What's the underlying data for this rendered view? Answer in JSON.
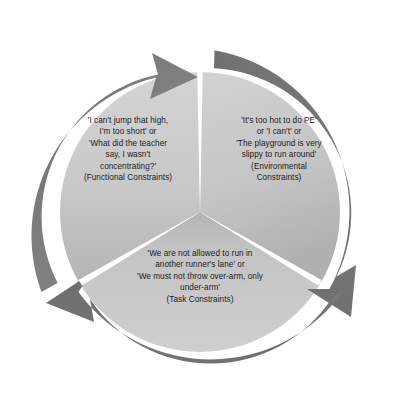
{
  "diagram": {
    "type": "cyclical-three-segment-pie",
    "title": "",
    "rotation_direction": "clockwise",
    "background_color": "#ffffff",
    "ring_color": "#7d7d7d",
    "ring_color_dark": "#6e6e6e",
    "segment_color_light": "#cfcfcf",
    "segment_color_mid": "#c2c2c2",
    "segment_color_dark": "#9e9e9e",
    "gap_color": "#ffffff",
    "text_color": "#1c1c1c",
    "segments": [
      {
        "id": "functional",
        "name": "Functional Constraints",
        "position": "left",
        "text": "'I can't jump that high,\nI'm too short' or\n'What did the teacher\nsay, I wasn't\nconcentrating?'\n(Functional Constraints)",
        "lines": [
          "'I can't jump that high,",
          "I'm too short' or",
          "'What did the teacher",
          "say, I wasn't",
          "concentrating?'",
          "(Functional Constraints)"
        ]
      },
      {
        "id": "environmental",
        "name": "Environmental Constraints",
        "position": "right",
        "text": "'It's too hot to do PE'\nor 'I can't' or\n'The playground is very\nslippy to run around'\n(Environmental\nConstraints)",
        "lines": [
          "'It's too hot to do PE'",
          "or 'I can't' or",
          "'The playground is very",
          "slippy to run around'",
          "(Environmental",
          "Constraints)"
        ]
      },
      {
        "id": "task",
        "name": "Task Constraints",
        "position": "bottom",
        "text": "'We are not allowed to run in\nanother runner's lane' or\n'We must not throw over-arm, only\nunder-arm'\n(Task Constraints)",
        "lines": [
          "'We are not allowed to run in",
          "another runner's lane' or",
          "'We must not throw over-arm, only",
          "under-arm'",
          "(Task Constraints)"
        ]
      }
    ],
    "arrows": [
      {
        "id": "arrow-top",
        "direction": "clockwise",
        "head_position": "top-center"
      },
      {
        "id": "arrow-right",
        "direction": "clockwise",
        "head_position": "lower-right"
      },
      {
        "id": "arrow-left",
        "direction": "clockwise",
        "head_position": "lower-left"
      }
    ]
  }
}
